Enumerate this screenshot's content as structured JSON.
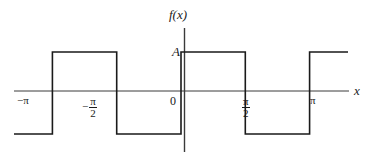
{
  "figure": {
    "kind": "square-wave-plot",
    "background_color": "#ffffff",
    "line_color": "#1a1a1a",
    "axis_label_y": "f(x)",
    "axis_label_x": "x",
    "amplitude_label": "A",
    "origin_label": "0"
  },
  "ticks": {
    "neg_pi": "−π",
    "neg_half_pi_sign": "−",
    "neg_half_pi_num": "π",
    "neg_half_pi_den": "2",
    "half_pi_num": "π",
    "half_pi_den": "2",
    "pi": "π"
  },
  "chart_data": {
    "type": "line",
    "title": "",
    "subtitle": "",
    "xlabel": "x",
    "ylabel": "f(x)",
    "xlim": [
      -4.08,
      4.08
    ],
    "ylim": [
      -1.45,
      1.45
    ],
    "grid": false,
    "legend": null,
    "x_tick_labels": [
      "−π",
      "−π/2",
      "0",
      "π/2",
      "π"
    ],
    "x_tick_values": [
      -3.14159,
      -1.5708,
      0,
      1.5708,
      3.14159
    ],
    "y_tick_labels": [
      "A"
    ],
    "y_tick_values": [
      1
    ],
    "annotations": [
      {
        "text": "A",
        "x": 0,
        "y": 1,
        "note": "amplitude level marked on y-axis"
      },
      {
        "text": "f(x)",
        "x": 0,
        "y": 1.45,
        "note": "y-axis name at top"
      },
      {
        "text": "x",
        "x": 4.08,
        "y": 0,
        "note": "x-axis name at right"
      }
    ],
    "series": [
      {
        "name": "f(x)",
        "step": "post",
        "x": [
          -4.08,
          -3.14159,
          -3.14159,
          -1.5708,
          -1.5708,
          0,
          0,
          1.5708,
          1.5708,
          3.14159,
          3.14159,
          4.08
        ],
        "y": [
          -1,
          -1,
          1,
          1,
          -1,
          -1,
          1,
          1,
          -1,
          -1,
          1,
          1
        ]
      }
    ],
    "segments": [
      {
        "level": -1,
        "x_from": -4.08,
        "x_to": -3.14159
      },
      {
        "level": 1,
        "x_from": -3.14159,
        "x_to": -1.5708
      },
      {
        "level": -1,
        "x_from": -1.5708,
        "x_to": 0
      },
      {
        "level": 1,
        "x_from": 0,
        "x_to": 1.5708
      },
      {
        "level": -1,
        "x_from": 1.5708,
        "x_to": 3.14159
      },
      {
        "level": 1,
        "x_from": 3.14159,
        "x_to": 4.08
      }
    ]
  }
}
